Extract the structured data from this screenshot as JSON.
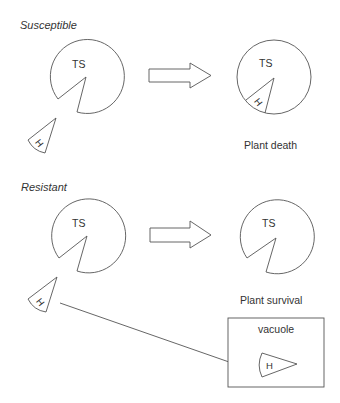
{
  "diagram": {
    "sections": [
      {
        "title": "Susceptible",
        "before": {
          "enzyme_label": "TS",
          "inhibitor_label": "H",
          "inhibitor_bound": false
        },
        "after": {
          "enzyme_label": "TS",
          "inhibitor_label": "H",
          "inhibitor_bound": true
        },
        "outcome": "Plant death"
      },
      {
        "title": "Resistant",
        "before": {
          "enzyme_label": "TS",
          "inhibitor_label": "H",
          "inhibitor_bound": false
        },
        "after": {
          "enzyme_label": "TS",
          "inhibitor_bound": false
        },
        "outcome": "Plant survival",
        "sequestration": {
          "compartment_label": "vacuole",
          "inhibitor_label": "H"
        }
      }
    ],
    "colors": {
      "stroke": "#555555",
      "text": "#333333",
      "background": "#ffffff"
    }
  }
}
